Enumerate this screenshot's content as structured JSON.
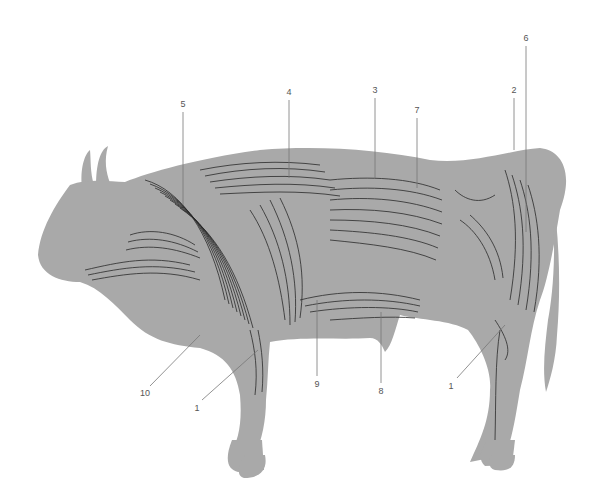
{
  "diagram": {
    "style": {
      "body_fill": "#a9a9a9",
      "muscle_line": "#2a2a2a",
      "leader_line": "#777777",
      "label_color": "#555555",
      "background": "#ffffff"
    },
    "labels": [
      {
        "id": "l1a",
        "text": "1",
        "x": 197,
        "y": 408,
        "line": [
          202,
          400,
          258,
          350
        ]
      },
      {
        "id": "l1b",
        "text": "1",
        "x": 451,
        "y": 386,
        "line": [
          457,
          378,
          505,
          325
        ]
      },
      {
        "id": "l2",
        "text": "2",
        "x": 514,
        "y": 90,
        "line": [
          514,
          98,
          514,
          150
        ]
      },
      {
        "id": "l3",
        "text": "3",
        "x": 375,
        "y": 90,
        "line": [
          375,
          98,
          375,
          178
        ]
      },
      {
        "id": "l4",
        "text": "4",
        "x": 289,
        "y": 92,
        "line": [
          289,
          100,
          289,
          178
        ]
      },
      {
        "id": "l5",
        "text": "5",
        "x": 183,
        "y": 104,
        "line": [
          183,
          112,
          183,
          205
        ]
      },
      {
        "id": "l6",
        "text": "6",
        "x": 526,
        "y": 38,
        "line": [
          526,
          46,
          526,
          232
        ]
      },
      {
        "id": "l7",
        "text": "7",
        "x": 417,
        "y": 110,
        "line": [
          417,
          118,
          417,
          188
        ]
      },
      {
        "id": "l8",
        "text": "8",
        "x": 381,
        "y": 391,
        "line": [
          381,
          383,
          381,
          312
        ]
      },
      {
        "id": "l9",
        "text": "9",
        "x": 317,
        "y": 384,
        "line": [
          317,
          376,
          317,
          300
        ]
      },
      {
        "id": "l10",
        "text": "10",
        "x": 145,
        "y": 393,
        "line": [
          150,
          386,
          200,
          335
        ]
      }
    ]
  }
}
